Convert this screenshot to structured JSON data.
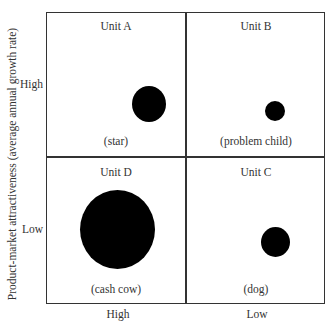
{
  "diagram": {
    "type": "bcg-growth-share-matrix",
    "y_axis": {
      "title": "Product-market attractiveness (average annual growth rate)",
      "ticks": [
        "High",
        "Low"
      ]
    },
    "x_axis": {
      "ticks": [
        "High",
        "Low"
      ]
    },
    "quadrants": [
      {
        "position": "top-left",
        "unit": "Unit A",
        "category": "(star)"
      },
      {
        "position": "top-right",
        "unit": "Unit B",
        "category": "(problem child)"
      },
      {
        "position": "bottom-left",
        "unit": "Unit D",
        "category": "(cash cow)"
      },
      {
        "position": "bottom-right",
        "unit": "Unit C",
        "category": "(dog)"
      }
    ],
    "bubbles": [
      {
        "unit": "Unit A",
        "relative_size": "medium"
      },
      {
        "unit": "Unit B",
        "relative_size": "small"
      },
      {
        "unit": "Unit D",
        "relative_size": "large"
      },
      {
        "unit": "Unit C",
        "relative_size": "small-medium"
      }
    ],
    "colors": {
      "bubble": "#000000",
      "grid": "#333333",
      "text": "#333333"
    }
  }
}
